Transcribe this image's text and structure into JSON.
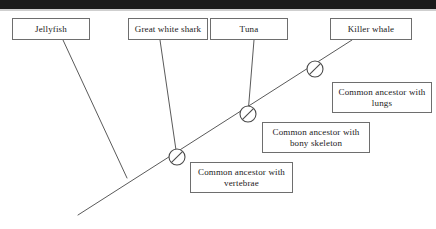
{
  "diagram": {
    "line_color": "#5a5a5a",
    "box_border_color": "#6e6e6e",
    "background": "#ffffff",
    "top_bar_color": "#1b1b1b"
  },
  "taxa": [
    {
      "id": "jellyfish",
      "label": "Jellyfish",
      "x": 12,
      "y": 18,
      "w": 78,
      "tip_x": 63,
      "tip_y": 40
    },
    {
      "id": "great-white",
      "label": "Great white shark",
      "x": 128,
      "y": 18,
      "w": 80,
      "tip_x": 160,
      "tip_y": 40
    },
    {
      "id": "tuna",
      "label": "Tuna",
      "x": 210,
      "y": 18,
      "w": 78,
      "tip_x": 254,
      "tip_y": 40
    },
    {
      "id": "killer-whale",
      "label": "Killer whale",
      "x": 330,
      "y": 18,
      "w": 82,
      "tip_x": 352,
      "tip_y": 40
    }
  ],
  "ancestors": [
    {
      "id": "vertebrae",
      "label": "Common ancestor with vertebrae",
      "x": 190,
      "y": 162,
      "w": 103,
      "node_x": 177,
      "node_y": 157
    },
    {
      "id": "bony-skeleton",
      "label": "Common ancestor with bony skeleton",
      "x": 262,
      "y": 122,
      "w": 108,
      "node_x": 248,
      "node_y": 114
    },
    {
      "id": "lungs",
      "label": "Common ancestor with lungs",
      "x": 332,
      "y": 82,
      "w": 100,
      "node_x": 315,
      "node_y": 69
    }
  ],
  "backbone": {
    "root_x": 78,
    "root_y": 215,
    "tip_x": 352,
    "tip_y": 40
  },
  "node_marker": {
    "radius": 8,
    "name": "crossed-circle-node"
  }
}
